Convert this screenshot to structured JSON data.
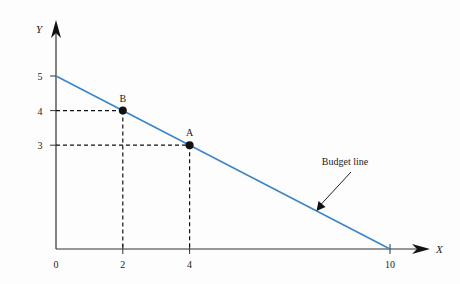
{
  "chart_data": {
    "type": "line",
    "title": "",
    "xlabel": "X",
    "ylabel": "Y",
    "xlim": [
      0,
      10
    ],
    "ylim": [
      0,
      5
    ],
    "x_ticks": [
      0,
      2,
      4,
      10
    ],
    "y_ticks": [
      3,
      4,
      5
    ],
    "grid": false,
    "series": [
      {
        "name": "Budget line",
        "points": [
          [
            0,
            5
          ],
          [
            10,
            0
          ]
        ],
        "color": "#3a86c8"
      }
    ],
    "points": [
      {
        "label": "B",
        "x": 2,
        "y": 4
      },
      {
        "label": "A",
        "x": 4,
        "y": 3
      }
    ],
    "annotations": [
      {
        "text": "Budget line",
        "arrow_to": [
          7.8,
          1.1
        ]
      }
    ]
  }
}
